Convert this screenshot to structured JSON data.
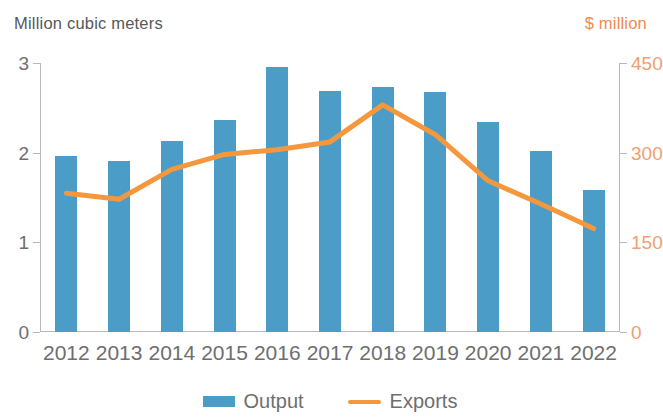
{
  "chart_data": {
    "type": "bar",
    "title": "",
    "subtitle": "",
    "xlabel": "",
    "ylabel": "Million cubic meters",
    "y2label": "$ million",
    "categories": [
      "2012",
      "2013",
      "2014",
      "2015",
      "2016",
      "2017",
      "2018",
      "2019",
      "2020",
      "2021",
      "2022"
    ],
    "grid": false,
    "legend_position": "bottom",
    "ylim": [
      0,
      3
    ],
    "yticks": [
      "0",
      "1",
      "2",
      "3"
    ],
    "ytick_values": [
      0,
      1,
      2,
      3
    ],
    "y2lim": [
      0,
      450
    ],
    "y2ticks": [
      "0",
      "150",
      "300",
      "450"
    ],
    "y2tick_values": [
      0,
      150,
      300,
      450
    ],
    "series": [
      {
        "name": "Output",
        "type": "bar",
        "axis": "left",
        "units": "Million cubic meters",
        "color": "#4c9cc8",
        "values": [
          1.96,
          1.91,
          2.13,
          2.37,
          2.96,
          2.69,
          2.73,
          2.68,
          2.34,
          2.02,
          1.58
        ]
      },
      {
        "name": "Exports",
        "type": "line",
        "axis": "right",
        "units": "$ million",
        "color": "#f5973d",
        "values": [
          232,
          222,
          272,
          297,
          305,
          318,
          380,
          330,
          253,
          214,
          173
        ]
      }
    ]
  },
  "axes": {
    "left_caption": "Million cubic meters",
    "right_caption": "$ million",
    "left_tick_labels": [
      "3",
      "2",
      "1",
      "0"
    ],
    "right_tick_labels": [
      "450",
      "300",
      "150",
      "0"
    ]
  },
  "legend": {
    "items": [
      {
        "label": "Output",
        "swatch": "bar-swatch",
        "color": "#4c9cc8"
      },
      {
        "label": "Exports",
        "swatch": "line-swatch",
        "color": "#f5973d"
      }
    ]
  },
  "colors": {
    "bar": "#4c9cc8",
    "line": "#f5973d",
    "left_axis_text": "#6d6e70",
    "right_axis_text": "#f0a071",
    "axis_rule": "#b9b9bb"
  }
}
